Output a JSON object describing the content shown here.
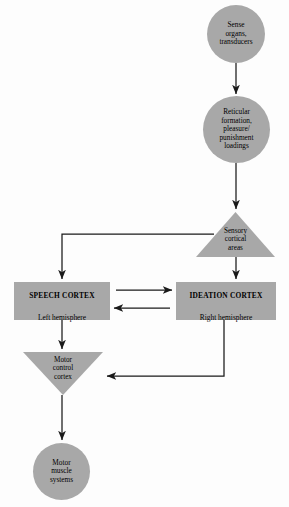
{
  "diagram": {
    "type": "flowchart",
    "orientation": "vertical",
    "style": {
      "node_fill": "#a8a8a8",
      "edge_color": "#1a1a1a",
      "text_color": "#000000",
      "background": "#fdfdfd"
    },
    "nodes": [
      {
        "id": "sense_organs",
        "shape": "circle",
        "label": "Sense\norgans,\ntransducers"
      },
      {
        "id": "reticular_formation",
        "shape": "circle",
        "label": "Reticular\nformation,\npleasure/\npunishment\nloadings"
      },
      {
        "id": "sensory_cortical_areas",
        "shape": "triangle-up",
        "label": "Sensory\ncortical\nareas"
      },
      {
        "id": "speech_cortex",
        "shape": "rectangle",
        "title": "SPEECH CORTEX",
        "subtitle": "Left hemisphere"
      },
      {
        "id": "ideation_cortex",
        "shape": "rectangle",
        "title": "IDEATION CORTEX",
        "subtitle": "Right hemisphere"
      },
      {
        "id": "motor_control_cortex",
        "shape": "triangle-down",
        "label": "Motor\ncontrol\ncortex"
      },
      {
        "id": "motor_muscle_systems",
        "shape": "circle",
        "label": "Motor\nmuscle\nsystems"
      }
    ],
    "edges": [
      {
        "from": "sense_organs",
        "to": "reticular_formation",
        "style": "straight-down",
        "arrow": "single"
      },
      {
        "from": "reticular_formation",
        "to": "sensory_cortical_areas",
        "style": "straight-down",
        "arrow": "single"
      },
      {
        "from": "sensory_cortical_areas",
        "to": "speech_cortex",
        "style": "elbow-left-down",
        "arrow": "single"
      },
      {
        "from": "sensory_cortical_areas",
        "to": "ideation_cortex",
        "style": "straight-down",
        "arrow": "single"
      },
      {
        "from": "speech_cortex",
        "to": "ideation_cortex",
        "style": "horizontal",
        "arrow": "single"
      },
      {
        "from": "ideation_cortex",
        "to": "speech_cortex",
        "style": "horizontal",
        "arrow": "single"
      },
      {
        "from": "speech_cortex",
        "to": "motor_control_cortex",
        "style": "straight-down",
        "arrow": "single"
      },
      {
        "from": "ideation_cortex",
        "to": "motor_control_cortex",
        "style": "elbow-down-left",
        "arrow": "single"
      },
      {
        "from": "motor_control_cortex",
        "to": "motor_muscle_systems",
        "style": "straight-down",
        "arrow": "single"
      }
    ]
  }
}
